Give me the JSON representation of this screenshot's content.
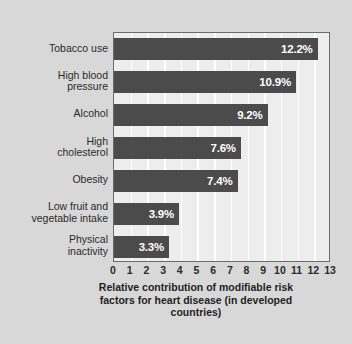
{
  "chart_data": {
    "type": "bar",
    "orientation": "horizontal",
    "title": "",
    "xlabel": "Relative contribution of modifiable risk\nfactors for heart disease (in developed\ncountries)",
    "ylabel": "",
    "xlim": [
      0,
      13
    ],
    "grid": true,
    "legend": "none",
    "categories": [
      "Tobacco use",
      "High blood\npressure",
      "Alcohol",
      "High\ncholesterol",
      "Obesity",
      "Low fruit and\nvegetable intake",
      "Physical\ninactivity"
    ],
    "values": [
      12.2,
      10.9,
      9.2,
      7.6,
      7.4,
      3.9,
      3.3
    ],
    "value_labels": [
      "12.2%",
      "10.9%",
      "9.2%",
      "7.6%",
      "7.4%",
      "3.9%",
      "3.3%"
    ],
    "xticks": [
      0,
      1,
      2,
      3,
      4,
      5,
      6,
      7,
      8,
      9,
      10,
      11,
      12,
      13
    ],
    "xtick_labels": [
      "0",
      "1",
      "2",
      "3",
      "4",
      "5",
      "6",
      "7",
      "8",
      "9",
      "10",
      "11",
      "12",
      "13"
    ],
    "colors": {
      "bar": "#4b4b4b",
      "plot_background": "#ededed",
      "card_background": "#d8d8d8",
      "gridline": "#ffffff",
      "axis_border": "#6b6b6b",
      "label_text": "#2b2b2b",
      "value_text": "#ffffff"
    }
  }
}
